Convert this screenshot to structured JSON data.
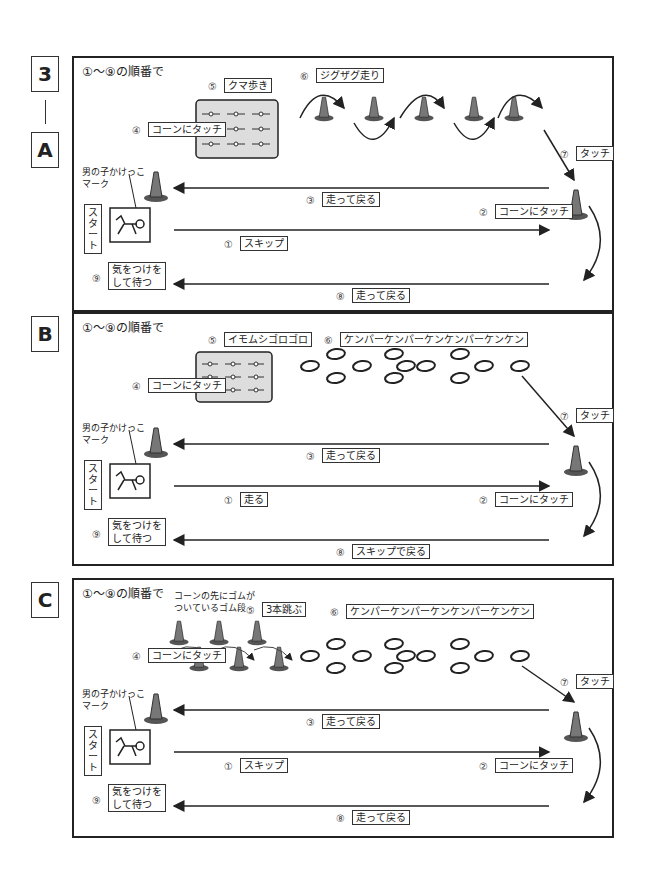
{
  "side_labels": {
    "a_top": "3",
    "a_dash": "|",
    "a": "A",
    "b": "B",
    "c": "C"
  },
  "common": {
    "order": "①～⑨の順番で",
    "start": "スタート",
    "mark": "男の子かけっこ\nマーク",
    "touch_cone": "コーンにタッチ",
    "touch": "タッチ",
    "wait": "気をつけを\nして待つ"
  },
  "nums": [
    "①",
    "②",
    "③",
    "④",
    "⑤",
    "⑥",
    "⑦",
    "⑧",
    "⑨"
  ],
  "panels": [
    {
      "id": "A",
      "step1": "スキップ",
      "step3": "走って戻る",
      "step5": "クマ歩き",
      "step6": "ジグザグ走り",
      "step8": "走って戻る"
    },
    {
      "id": "B",
      "step1": "走る",
      "step3": "走って戻る",
      "step5": "イモムシゴロゴロ",
      "step6": "ケンパーケンパーケンケンパーケンケン",
      "step8": "スキップで戻る"
    },
    {
      "id": "C",
      "step1": "スキップ",
      "step3": "走って戻る",
      "step5": "3本跳ぶ",
      "step5_note": "コーンの先にゴムが\nついているゴム段",
      "step6": "ケンパーケンパーケンケンパーケンケン",
      "step8": "走って戻る"
    }
  ],
  "colors": {
    "cone": "#777777",
    "mat": "#dddddd",
    "line": "#222222"
  }
}
